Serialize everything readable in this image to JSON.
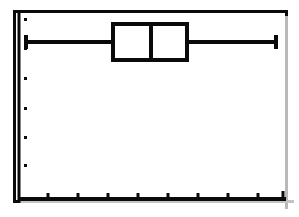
{
  "screen": {
    "width": 299,
    "height": 217,
    "background_color": "#ffffff",
    "ink_color": "#0a0a0a",
    "device": "graphing-calculator-plot-screen"
  },
  "frame": {
    "label": "plot-window-frame",
    "x": 13,
    "y": 10,
    "width": 275,
    "height": 193,
    "border_width": 3
  },
  "chart_data": {
    "type": "box",
    "title": "",
    "subtitle": "",
    "xlabel": "",
    "ylabel": "",
    "orientation": "horizontal",
    "grid": false,
    "legend": null,
    "series": [
      {
        "name": "Plot1",
        "min": 13,
        "q1": 100,
        "median": 138,
        "q3": 174,
        "max": 263,
        "whisker_low_label": "minX",
        "whisker_high_label": "maxX",
        "pixels": {
          "whisker_left_x": 26,
          "box_left_x": 113,
          "median_x": 151,
          "box_right_x": 187,
          "whisker_right_x": 276,
          "center_y": 42,
          "box_top_y": 24,
          "box_bottom_y": 60
        }
      }
    ],
    "xaxis": {
      "position": "bottom",
      "min": 0,
      "max": 275,
      "tick_pixels": [
        48,
        78,
        108,
        138,
        168,
        198,
        228,
        258
      ],
      "tick_labels": [],
      "tick_count": 8,
      "axis_line": true
    },
    "yaxis": {
      "position": "left",
      "min": 0,
      "max": 193,
      "tick_pixels": [
        19,
        48,
        78,
        108,
        137,
        165
      ],
      "tick_labels": [],
      "tick_count": 6,
      "axis_line": true,
      "tick_style": "dot"
    }
  },
  "elements": {
    "box_label": "interquartile-box",
    "median_label": "median-line",
    "left_whisker_label": "left-whisker",
    "right_whisker_label": "right-whisker",
    "left_cap_label": "left-whisker-cap",
    "right_cap_label": "right-whisker-cap",
    "x_axis_label": "x-axis-line",
    "y_axis_label": "y-axis-line"
  }
}
